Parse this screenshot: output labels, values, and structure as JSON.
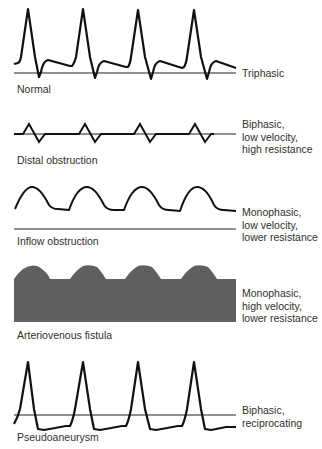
{
  "panels": [
    {
      "id": "normal",
      "caption": "Normal",
      "description_lines": [
        "Triphasic"
      ],
      "waveform": "triphasic"
    },
    {
      "id": "distal-obstruction",
      "caption": "Distal obstruction",
      "description_lines": [
        "Biphasic,",
        "low velocity,",
        "high resistance"
      ],
      "waveform": "biphasic-low-velocity"
    },
    {
      "id": "inflow-obstruction",
      "caption": "Inflow obstruction",
      "description_lines": [
        "Monophasic,",
        "low velocity,",
        "lower resistance"
      ],
      "waveform": "monophasic-low-velocity"
    },
    {
      "id": "arteriovenous-fistula",
      "caption": "Arteriovenous fistula",
      "description_lines": [
        "Monophasic,",
        "high velocity,",
        "lower resistance"
      ],
      "waveform": "monophasic-high-velocity-filled"
    },
    {
      "id": "pseudoaneurysm",
      "caption": "Pseudoaneurysm",
      "description_lines": [
        "Biphasic,",
        "reciprocating"
      ],
      "waveform": "biphasic-reciprocating"
    }
  ],
  "colors": {
    "trace": "#111111",
    "baseline": "#222222",
    "fill": "#5f5f5f",
    "text": "#2f2f2f"
  }
}
